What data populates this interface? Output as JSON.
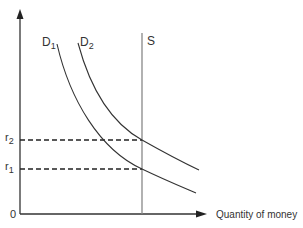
{
  "diagram": {
    "type": "money market supply-demand",
    "axes": {
      "origin_label": "0",
      "x_label": "Quantity of money",
      "y_label": ""
    },
    "curves": [
      {
        "id": "D1",
        "label_main": "D",
        "label_sub": "1",
        "kind": "demand"
      },
      {
        "id": "D2",
        "label_main": "D",
        "label_sub": "2",
        "kind": "demand"
      },
      {
        "id": "S",
        "label_main": "S",
        "label_sub": "",
        "kind": "supply (vertical)"
      }
    ],
    "levels": [
      {
        "id": "r2",
        "label_main": "r",
        "label_sub": "2"
      },
      {
        "id": "r1",
        "label_main": "r",
        "label_sub": "1"
      }
    ],
    "colors": {
      "line": "#333333",
      "supply": "#888888"
    }
  }
}
